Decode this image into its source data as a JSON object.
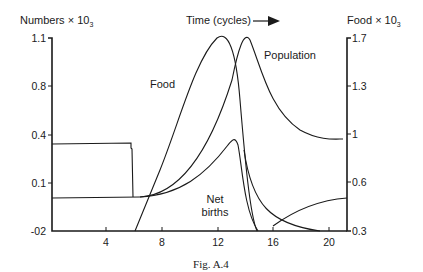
{
  "chart_data": {
    "type": "line",
    "title": "Time (cycles)",
    "caption": "Fig. A.4",
    "xlabel": "Time (cycles)",
    "ylabel_left": "Numbers × 10",
    "ylabel_left_sub": "3",
    "ylabel_right": "Food × 10",
    "ylabel_right_sub": "3",
    "x_ticks": [
      "4",
      "8",
      "12",
      "16",
      "20"
    ],
    "y_left_ticks": [
      "1.1",
      "0.8",
      "0.4",
      "0.1",
      "-02"
    ],
    "y_right_ticks": [
      "1.7",
      "1.3",
      "1",
      "0.6",
      "0.3"
    ],
    "xlim": [
      0,
      21
    ],
    "grid": false,
    "series": [
      {
        "name": "Food",
        "axis": "right",
        "x": [
          6,
          8,
          10,
          12,
          13,
          14,
          15
        ],
        "values": [
          0.3,
          0.8,
          1.35,
          1.7,
          1.4,
          0.7,
          0.3
        ]
      },
      {
        "name": "Population",
        "axis": "left",
        "x": [
          0,
          6,
          7,
          10,
          12,
          14,
          16,
          18,
          21
        ],
        "values": [
          0.05,
          0.05,
          0.07,
          0.3,
          0.7,
          1.1,
          0.6,
          0.38,
          0.33
        ]
      },
      {
        "name": "Net births",
        "axis": "left",
        "x": [
          0,
          6,
          7,
          10,
          12,
          13,
          14,
          15
        ],
        "values": [
          0.05,
          0.05,
          0.07,
          0.15,
          0.28,
          0.36,
          0.1,
          -0.02
        ]
      },
      {
        "name": "Initial block",
        "axis": "left",
        "x": [
          0,
          5.8,
          5.8,
          6,
          6
        ],
        "values": [
          0.32,
          0.32,
          0.3,
          0.3,
          0.05
        ]
      }
    ],
    "annotations": [
      "Food",
      "Population",
      "Net births"
    ]
  }
}
